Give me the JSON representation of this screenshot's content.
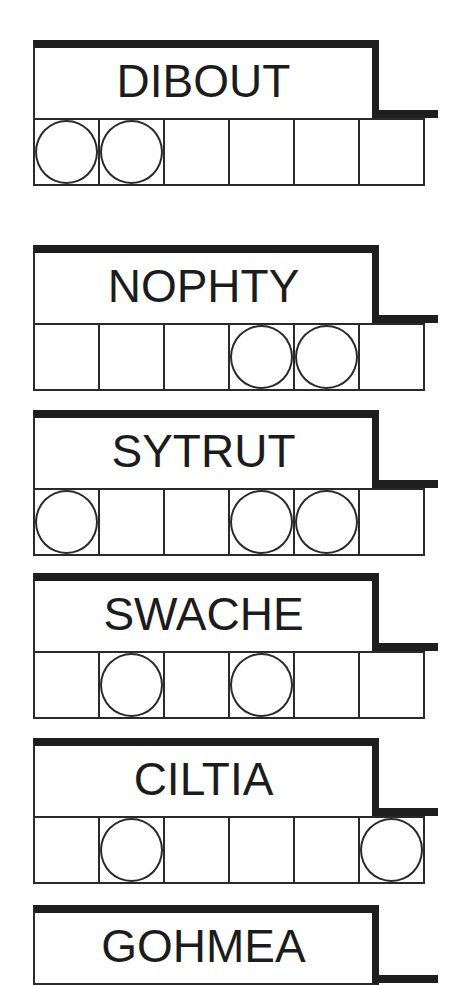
{
  "puzzles": [
    {
      "scrambled": "DIBOUT",
      "circled": [
        true,
        true,
        false,
        false,
        false,
        false
      ],
      "top": 40
    },
    {
      "scrambled": "NOPHTY",
      "circled": [
        false,
        false,
        false,
        true,
        true,
        false
      ],
      "top": 245
    },
    {
      "scrambled": "SYTRUT",
      "circled": [
        true,
        false,
        false,
        true,
        true,
        false
      ],
      "top": 410
    },
    {
      "scrambled": "SWACHE",
      "circled": [
        false,
        true,
        false,
        true,
        false,
        false
      ],
      "top": 573
    },
    {
      "scrambled": "CILTIA",
      "circled": [
        false,
        true,
        false,
        false,
        false,
        true
      ],
      "top": 738
    },
    {
      "scrambled": "GOHMEA",
      "circled": [],
      "top": 905
    }
  ],
  "colors": {
    "ink": "#1e1e1e",
    "background": "#ffffff"
  }
}
